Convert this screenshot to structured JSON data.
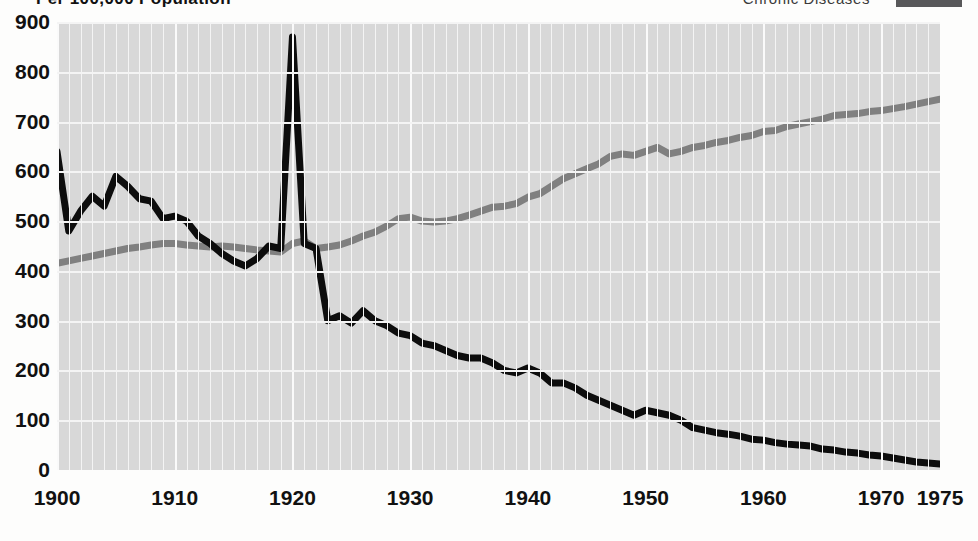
{
  "header": {
    "title": "Per 100,000 Population",
    "legend_label": "Chronic  Diseases",
    "legend_swatch_color": "#58585a"
  },
  "colors": {
    "plot_background": "#d8d8d8",
    "gridline": "#f4f4f4",
    "infectious_line": "#0d0d0d",
    "chronic_line": "#808080",
    "page_background": "#fdfdfc",
    "text": "#111111"
  },
  "chart_data": {
    "type": "line",
    "title": "Per 100,000 Population",
    "xlabel": "",
    "ylabel": "Per 100,000 Population",
    "xlim": [
      1900,
      1975
    ],
    "ylim": [
      0,
      900
    ],
    "grid": true,
    "legend_position": "top-right",
    "yticks": [
      900,
      800,
      700,
      600,
      500,
      400,
      300,
      200,
      100,
      0
    ],
    "xticks": [
      1900,
      1910,
      1920,
      1930,
      1940,
      1950,
      1960,
      1970,
      1975
    ],
    "x": [
      1900,
      1901,
      1902,
      1903,
      1904,
      1905,
      1906,
      1907,
      1908,
      1909,
      1910,
      1911,
      1912,
      1913,
      1914,
      1915,
      1916,
      1917,
      1918,
      1919,
      1920,
      1921,
      1922,
      1923,
      1924,
      1925,
      1926,
      1927,
      1928,
      1929,
      1930,
      1931,
      1932,
      1933,
      1934,
      1935,
      1936,
      1937,
      1938,
      1939,
      1940,
      1941,
      1942,
      1943,
      1944,
      1945,
      1946,
      1947,
      1948,
      1949,
      1950,
      1951,
      1952,
      1953,
      1954,
      1955,
      1956,
      1957,
      1958,
      1959,
      1960,
      1961,
      1962,
      1963,
      1964,
      1965,
      1966,
      1967,
      1968,
      1969,
      1970,
      1971,
      1972,
      1973,
      1974,
      1975
    ],
    "series": [
      {
        "name": "Infectious Diseases",
        "color": "#0d0d0d",
        "values": [
          640,
          480,
          520,
          550,
          530,
          590,
          570,
          545,
          540,
          505,
          510,
          500,
          470,
          455,
          435,
          420,
          410,
          425,
          450,
          445,
          870,
          455,
          445,
          300,
          310,
          295,
          320,
          300,
          290,
          275,
          270,
          255,
          250,
          240,
          230,
          225,
          225,
          215,
          200,
          195,
          205,
          195,
          175,
          175,
          165,
          150,
          140,
          130,
          120,
          110,
          120,
          115,
          110,
          100,
          85,
          80,
          75,
          72,
          68,
          62,
          60,
          55,
          52,
          50,
          48,
          42,
          40,
          36,
          34,
          30,
          28,
          24,
          20,
          16,
          14,
          12
        ]
      },
      {
        "name": "Chronic Diseases",
        "color": "#808080",
        "values": [
          415,
          420,
          425,
          430,
          435,
          440,
          445,
          448,
          452,
          455,
          455,
          452,
          450,
          448,
          450,
          448,
          445,
          442,
          440,
          438,
          455,
          460,
          445,
          448,
          452,
          460,
          470,
          478,
          490,
          505,
          508,
          500,
          498,
          500,
          505,
          512,
          520,
          528,
          530,
          535,
          548,
          555,
          570,
          585,
          595,
          605,
          615,
          630,
          635,
          632,
          640,
          648,
          635,
          640,
          648,
          652,
          658,
          662,
          668,
          672,
          680,
          682,
          690,
          695,
          700,
          705,
          712,
          714,
          716,
          720,
          722,
          726,
          730,
          735,
          740,
          745
        ]
      }
    ]
  }
}
